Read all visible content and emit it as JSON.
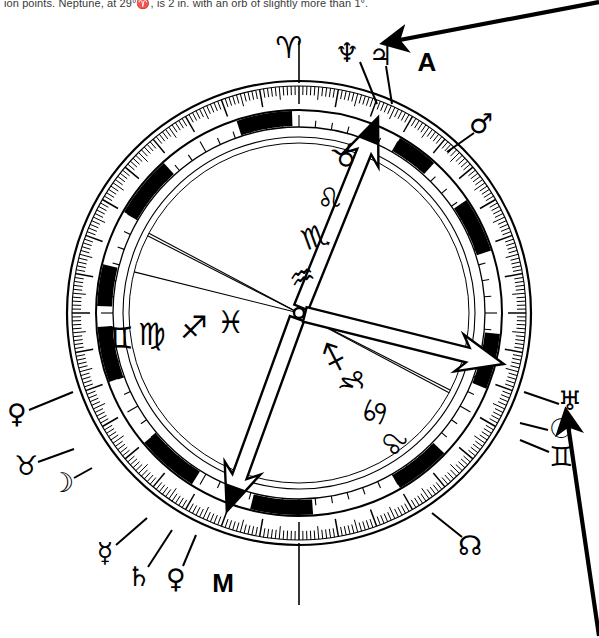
{
  "caption": {
    "text": "ion points. Neptune, at 29°♈, is 2 in. with an orb of slightly more than 1°."
  },
  "chart": {
    "type": "astrological-natal-wheel",
    "center": {
      "x": 299,
      "y": 313
    },
    "radii": {
      "outer_rim": 232,
      "tick_band_inner": 203,
      "degree_band_inner": 186,
      "house_circle": 176,
      "inner_circle": 170
    },
    "colors": {
      "ink": "#000000",
      "paper": "#ffffff",
      "caption": "#3a3a3a"
    },
    "angle_markers": [
      {
        "name": "ascendant",
        "label": "A",
        "glyph_label": "A",
        "label_x": 427,
        "label_y": 62,
        "arrow_angle_deg": -68,
        "arrow_style": "hollow-outline",
        "description": "Ascendant arrow pointing up-right"
      },
      {
        "name": "midheaven",
        "label": "M",
        "glyph_label": "M",
        "label_x": 223,
        "label_y": 583,
        "arrow_angle_deg": 110,
        "arrow_style": "hollow-outline",
        "description": "Midheaven arrow pointing down-left"
      },
      {
        "name": "descendant",
        "label": "",
        "glyph_label": "",
        "label_x": 0,
        "label_y": 0,
        "arrow_angle_deg": 14,
        "arrow_style": "hollow-outline",
        "description": "Descendant arrow pointing right"
      }
    ],
    "zodiac_band_signs": [
      {
        "sign": "aries",
        "glyph": "♈",
        "x": 289,
        "y": 47,
        "rotate": 0,
        "position": "top-outside-rim"
      }
    ],
    "inner_left_signs": [
      {
        "sign": "gemini",
        "glyph": "♊",
        "x": 120,
        "y": 338,
        "rotate": 0
      },
      {
        "sign": "virgo",
        "glyph": "♍",
        "x": 152,
        "y": 334,
        "rotate": 0
      },
      {
        "sign": "sagittarius",
        "glyph": "♐",
        "x": 194,
        "y": 327,
        "rotate": 0
      },
      {
        "sign": "pisces",
        "glyph": "♓",
        "x": 231,
        "y": 322,
        "rotate": 0
      }
    ],
    "inner_right_signs": [
      {
        "sign": "sagittarius",
        "glyph": "♐",
        "x": 334,
        "y": 357,
        "rotate": -72
      },
      {
        "sign": "capricorn",
        "glyph": "♑",
        "x": 353,
        "y": 381,
        "rotate": -72
      },
      {
        "sign": "cancer",
        "glyph": "♋",
        "x": 375,
        "y": 412,
        "rotate": -72
      },
      {
        "sign": "leo",
        "glyph": "♌",
        "x": 394,
        "y": 444,
        "rotate": -72
      }
    ],
    "axis_line_signs": [
      {
        "sign": "taurus",
        "glyph": "♉",
        "x": 345,
        "y": 157,
        "rotate": -20
      },
      {
        "sign": "leo",
        "glyph": "♌",
        "x": 329,
        "y": 199,
        "rotate": -20
      },
      {
        "sign": "scorpio",
        "glyph": "♏",
        "x": 315,
        "y": 237,
        "rotate": -20
      },
      {
        "sign": "aquarius",
        "glyph": "♒",
        "x": 302,
        "y": 277,
        "rotate": -20
      }
    ],
    "outer_planet_labels": [
      {
        "name": "neptune",
        "glyph": "♆",
        "x": 347,
        "y": 52,
        "pointer_from_x": 360,
        "pointer_from_y": 62,
        "pointer_to_x": 377,
        "pointer_to_y": 104
      },
      {
        "name": "jupiter",
        "glyph": "♃",
        "x": 381,
        "y": 55,
        "pointer_from_x": 386,
        "pointer_from_y": 66,
        "pointer_to_x": 392,
        "pointer_to_y": 104
      },
      {
        "name": "mars",
        "glyph": "♂",
        "x": 481,
        "y": 123,
        "pointer_from_x": 474,
        "pointer_from_y": 133,
        "pointer_to_x": 447,
        "pointer_to_y": 152
      },
      {
        "name": "uranus",
        "glyph": "♅",
        "x": 570,
        "y": 400,
        "pointer_from_x": 559,
        "pointer_from_y": 404,
        "pointer_to_x": 524,
        "pointer_to_y": 392
      },
      {
        "name": "sun",
        "glyph": "☉",
        "x": 561,
        "y": 428,
        "pointer_from_x": 548,
        "pointer_from_y": 430,
        "pointer_to_x": 520,
        "pointer_to_y": 423
      },
      {
        "name": "gemini",
        "glyph": "♊",
        "x": 561,
        "y": 456,
        "pointer_from_x": 549,
        "pointer_from_y": 452,
        "pointer_to_x": 520,
        "pointer_to_y": 440
      },
      {
        "name": "north-node",
        "glyph": "☊",
        "x": 470,
        "y": 545,
        "pointer_from_x": 462,
        "pointer_from_y": 537,
        "pointer_to_x": 432,
        "pointer_to_y": 513
      },
      {
        "name": "venus",
        "glyph": "♀",
        "x": 17,
        "y": 413,
        "pointer_from_x": 29,
        "pointer_from_y": 410,
        "pointer_to_x": 73,
        "pointer_to_y": 392
      },
      {
        "name": "taurus",
        "glyph": "♉",
        "x": 26,
        "y": 465,
        "pointer_from_x": 38,
        "pointer_from_y": 462,
        "pointer_to_x": 74,
        "pointer_to_y": 449
      },
      {
        "name": "moon",
        "glyph": "☽",
        "x": 62,
        "y": 482,
        "pointer_from_x": 74,
        "pointer_from_y": 478,
        "pointer_to_x": 92,
        "pointer_to_y": 468
      },
      {
        "name": "mercury",
        "glyph": "☿",
        "x": 105,
        "y": 552,
        "pointer_from_x": 116,
        "pointer_from_y": 545,
        "pointer_to_x": 147,
        "pointer_to_y": 518
      },
      {
        "name": "saturn",
        "glyph": "♄",
        "x": 139,
        "y": 576,
        "pointer_from_x": 148,
        "pointer_from_y": 567,
        "pointer_to_x": 172,
        "pointer_to_y": 530
      },
      {
        "name": "pluto",
        "glyph": "♀",
        "x": 176,
        "y": 578,
        "pointer_from_x": 183,
        "pointer_from_y": 566,
        "pointer_to_x": 196,
        "pointer_to_y": 535
      }
    ],
    "annotation_arrows": [
      {
        "name": "top-right-annotation-arrow",
        "x1": 599,
        "y1": 2,
        "x2": 384,
        "y2": 43,
        "head_at": "end",
        "solid": true
      },
      {
        "name": "bottom-right-annotation-arrow",
        "x1": 599,
        "y1": 636,
        "x2": 566,
        "y2": 411,
        "head_at": "end",
        "solid": true
      }
    ],
    "house_cusp_lines": [
      {
        "name": "cusp-ascendant",
        "angle_deg": -68
      },
      {
        "name": "cusp-descendant",
        "angle_deg": 14
      },
      {
        "name": "cusp-midheaven",
        "angle_deg": 110
      },
      {
        "name": "cusp-upper-left",
        "angle_deg": -152
      },
      {
        "name": "cusp-lower-right",
        "angle_deg": 27
      }
    ],
    "external_radial_lines": [
      {
        "name": "aries-marker-line",
        "angle_deg": -90,
        "outer_len": 40
      },
      {
        "name": "bottom-marker-line",
        "angle_deg": 90,
        "outer_len": 60
      }
    ],
    "ring_black_segments_deg": [
      [
        -108,
        -92
      ],
      [
        -150,
        -132
      ],
      [
        -178,
        -166
      ],
      [
        160,
        176
      ],
      [
        122,
        140
      ],
      [
        86,
        104
      ],
      [
        44,
        60
      ],
      [
        6,
        22
      ],
      [
        -34,
        -18
      ],
      [
        -60,
        -48
      ]
    ]
  }
}
